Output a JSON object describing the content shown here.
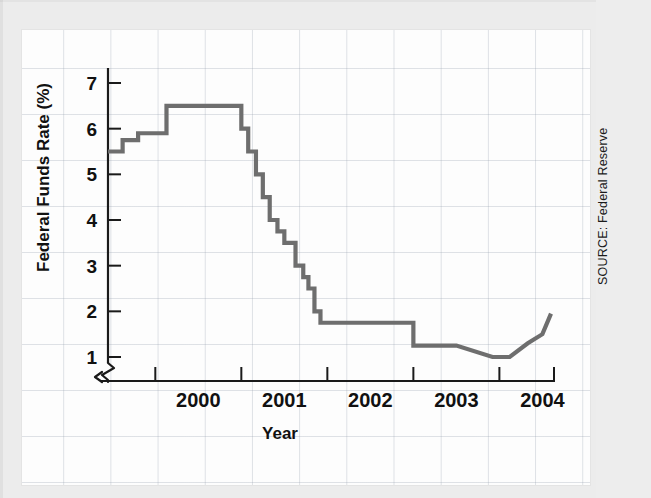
{
  "figure": {
    "source_note": "SOURCE: Federal Reserve",
    "background_color": "#ececec",
    "card_color": "#fdfdfd",
    "series_color": "#6e6e6e",
    "axis_color": "#1a1a1a"
  },
  "chart_data": {
    "type": "line",
    "title": "",
    "subtitle": "",
    "xlabel": "Year",
    "ylabel": "Federal Funds Rate (%)",
    "xlim": [
      1999.45,
      2004.6
    ],
    "ylim": [
      0.6,
      7.4
    ],
    "y_ticks": [
      1,
      2,
      3,
      4,
      5,
      6,
      7
    ],
    "y_tick_labels": [
      "1",
      "2",
      "3",
      "4",
      "5",
      "6",
      "7"
    ],
    "x_ticks": [
      2000,
      2001,
      2002,
      2003,
      2004
    ],
    "x_tick_labels": [
      "2000",
      "2001",
      "2002",
      "2003",
      "2004"
    ],
    "x_tick_label_offset": 0.5,
    "grid": true,
    "grid_style": "faint graph paper",
    "legend": "none",
    "y_axis_break": true,
    "drawstyle": "steps-post",
    "series": [
      {
        "name": "Federal Funds Rate",
        "color": "#6e6e6e",
        "x": [
          1999.45,
          1999.62,
          1999.8,
          2000.13,
          2000.38,
          2000.88,
          2001.0,
          2001.08,
          2001.17,
          2001.25,
          2001.33,
          2001.42,
          2001.5,
          2001.63,
          2001.72,
          2001.78,
          2001.85,
          2001.92,
          2002.0,
          2002.62,
          2003.0,
          2003.5,
          2003.92,
          2004.12,
          2004.33,
          2004.5,
          2004.6
        ],
        "y": [
          5.5,
          5.75,
          5.9,
          6.5,
          6.5,
          6.5,
          6.0,
          5.5,
          5.0,
          4.5,
          4.0,
          3.75,
          3.5,
          3.0,
          2.75,
          2.5,
          2.0,
          1.75,
          1.75,
          1.75,
          1.25,
          1.25,
          1.0,
          1.0,
          1.3,
          1.5,
          1.95
        ]
      }
    ],
    "annotations": []
  }
}
